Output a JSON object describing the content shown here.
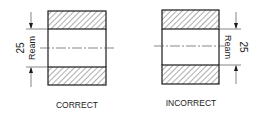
{
  "diagrams": [
    {
      "id": "correct",
      "caption": "CORRECT",
      "dimension_value": "25",
      "dimension_note": "Ream",
      "dimension_side": "left"
    },
    {
      "id": "incorrect",
      "caption": "INCORRECT",
      "dimension_value": "25",
      "dimension_note": "Ream",
      "dimension_side": "right"
    }
  ],
  "colors": {
    "line": "#1a1a1a",
    "hatch": "#333333",
    "background": "#ffffff"
  }
}
